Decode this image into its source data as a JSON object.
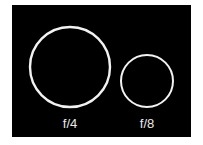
{
  "diagram": {
    "background_color": "#000000",
    "stroke_color": "#f2f2f2",
    "apertures": [
      {
        "label": "f/4",
        "relative_diameter": 1.0
      },
      {
        "label": "f/8",
        "relative_diameter": 0.65
      }
    ]
  }
}
